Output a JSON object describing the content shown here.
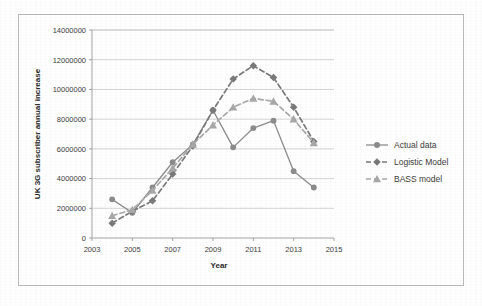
{
  "chart_data": {
    "type": "line",
    "title": "",
    "xlabel": "Year",
    "ylabel": "UK 3G subscriber annual increase",
    "x": [
      2004,
      2005,
      2006,
      2007,
      2008,
      2009,
      2010,
      2011,
      2012,
      2013,
      2014
    ],
    "xlim": [
      2003,
      2015
    ],
    "ylim": [
      0,
      14000000
    ],
    "xticks": [
      "2003",
      "2005",
      "2007",
      "2009",
      "2011",
      "2013",
      "2015"
    ],
    "xtick_values": [
      2003,
      2005,
      2007,
      2009,
      2011,
      2013,
      2015
    ],
    "yticks": [
      "0",
      "2000000",
      "4000000",
      "6000000",
      "8000000",
      "10000000",
      "12000000",
      "14000000"
    ],
    "ytick_values": [
      0,
      2000000,
      4000000,
      6000000,
      8000000,
      10000000,
      12000000,
      14000000
    ],
    "grid": "horizontal",
    "legend_position": "right",
    "series": [
      {
        "name": "Actual data",
        "marker": "circle",
        "line_style": "solid",
        "color": "#8b8b8b",
        "values": [
          2600000,
          1700000,
          3400000,
          5100000,
          6300000,
          8600000,
          6100000,
          7400000,
          7900000,
          4500000,
          3400000
        ]
      },
      {
        "name": "Logistic Model",
        "marker": "diamond",
        "line_style": "dashed",
        "color": "#7a7a7a",
        "values": [
          1000000,
          1800000,
          2500000,
          4300000,
          6200000,
          8600000,
          10700000,
          11600000,
          10800000,
          8800000,
          6500000
        ]
      },
      {
        "name": "BASS model",
        "marker": "triangle",
        "line_style": "dashed",
        "color": "#a8a8a8",
        "values": [
          1500000,
          1900000,
          3200000,
          4700000,
          6300000,
          7600000,
          8800000,
          9400000,
          9200000,
          8000000,
          6400000
        ]
      }
    ]
  },
  "legend": {
    "items": [
      {
        "label": "Actual data"
      },
      {
        "label": "Logistic Model"
      },
      {
        "label": "BASS model"
      }
    ]
  },
  "colors": {
    "grid": "#c9c9c9",
    "axis": "#9a9a9a",
    "frame": "#b9b9b9",
    "text": "#3d3d3d",
    "background": "#ffffff"
  }
}
